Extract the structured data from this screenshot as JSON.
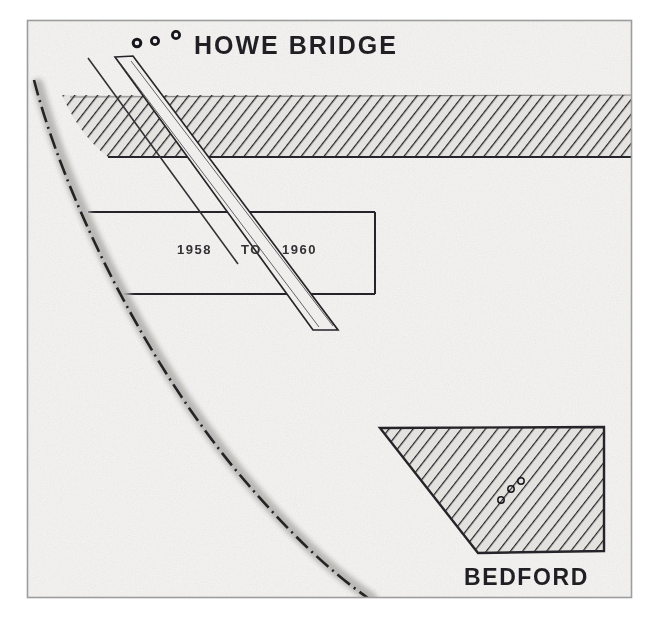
{
  "figure": {
    "type": "scanned-map-diagram",
    "background_color": "#f4f3f1",
    "frame_color": "#9a9a9a",
    "ink_color": "#19191c"
  },
  "labels": {
    "title": "HOWE BRIDGE",
    "period": {
      "from": "1958",
      "connector": "TO",
      "to": "1960"
    },
    "place": "BEDFORD"
  },
  "features": {
    "hatched_band": {
      "name": "hatched-band",
      "fill": "#e2e0dd",
      "hatch_color": "#1d1d20"
    },
    "bedford_block": {
      "name": "bedford-hatched-block",
      "fill": "#e2e0dd",
      "hatch_color": "#1d1d20"
    },
    "diagonal_strip": {
      "name": "diagonal-strip",
      "fill": "#efeeec",
      "stroke": "#1d1d20"
    },
    "boundary_curve": {
      "name": "dash-dot-boundary-curve",
      "stroke": "#1d1d20",
      "shadow": "#b9b7b4"
    },
    "dashed_centerline": {
      "name": "dashed-centerline",
      "stroke": "#2a2a2d"
    },
    "survey_rectangle": {
      "name": "survey-rectangle",
      "stroke": "#1d1d20"
    },
    "markers": [
      {
        "name": "circle-marker-1",
        "cx": 137,
        "cy": 43,
        "r": 4
      },
      {
        "name": "circle-marker-2",
        "cx": 155,
        "cy": 41,
        "r": 4
      },
      {
        "name": "circle-marker-3",
        "cx": 175,
        "cy": 35,
        "r": 4
      },
      {
        "name": "bedford-marker-1",
        "cx": 501,
        "cy": 500,
        "r": 3
      },
      {
        "name": "bedford-marker-2",
        "cx": 510,
        "cy": 490,
        "r": 3
      },
      {
        "name": "bedford-marker-3",
        "cx": 519,
        "cy": 482,
        "r": 3
      }
    ]
  }
}
